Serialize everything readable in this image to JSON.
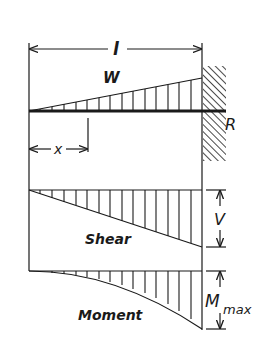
{
  "diagram": {
    "labels": {
      "span": "l",
      "load": "W",
      "reaction": "R",
      "position": "x",
      "shear_title": "Shear",
      "shear_value": "V",
      "moment_title": "Moment",
      "moment_value": "M",
      "moment_subscript": "max"
    },
    "colors": {
      "ink": "#1a1a1a",
      "background": "#ffffff"
    }
  }
}
